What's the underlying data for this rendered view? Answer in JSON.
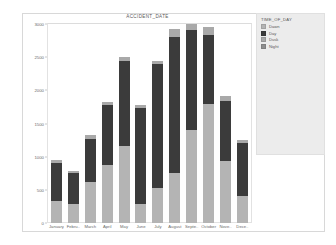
{
  "legend": {
    "title": "TIME_OF_DAY",
    "position": "right",
    "items": [
      {
        "label": "Dawn",
        "color": "#b4b4b4"
      },
      {
        "label": "Day",
        "color": "#3b3b3b"
      },
      {
        "label": "Dusk",
        "color": "#a9a9a9"
      },
      {
        "label": "Night",
        "color": "#8e8e8e"
      }
    ]
  },
  "chart_data": {
    "type": "bar",
    "stacked": true,
    "title": "ACCIDENT_DATE",
    "xlabel": "",
    "ylabel": "Number of Records",
    "ylim": [
      0,
      3000
    ],
    "yticks": [
      0,
      500,
      1000,
      1500,
      2000,
      2500,
      3000
    ],
    "ytick_labels": [
      "0",
      "500",
      "1000",
      "1500",
      "2000",
      "2500",
      "3000"
    ],
    "grid": false,
    "legend_position": "right",
    "categories": [
      "January",
      "Febru..",
      "March",
      "April",
      "May",
      "June",
      "July",
      "August",
      "Septe..",
      "October",
      "Nove..",
      "Dece.."
    ],
    "series": [
      {
        "name": "Dawn",
        "color": "#b4b4b4",
        "values": [
          330,
          290,
          620,
          880,
          1160,
          290,
          530,
          760,
          1450,
          1790,
          940,
          400
        ]
      },
      {
        "name": "Day",
        "color": "#3b3b3b",
        "values": [
          580,
          470,
          640,
          900,
          1290,
          1450,
          1860,
          2050,
          1560,
          1040,
          900,
          800
        ]
      },
      {
        "name": "Dusk",
        "color": "#a9a9a9",
        "values": [
          40,
          30,
          70,
          50,
          60,
          40,
          60,
          110,
          90,
          120,
          70,
          50
        ]
      },
      {
        "name": "Night",
        "color": "#8e8e8e",
        "values": [
          0,
          0,
          0,
          0,
          0,
          0,
          0,
          0,
          0,
          0,
          0,
          0
        ]
      }
    ],
    "totals": [
      950,
      790,
      1330,
      1830,
      2510,
      1780,
      2450,
      2920,
      3100,
      2950,
      1910,
      1250
    ]
  }
}
